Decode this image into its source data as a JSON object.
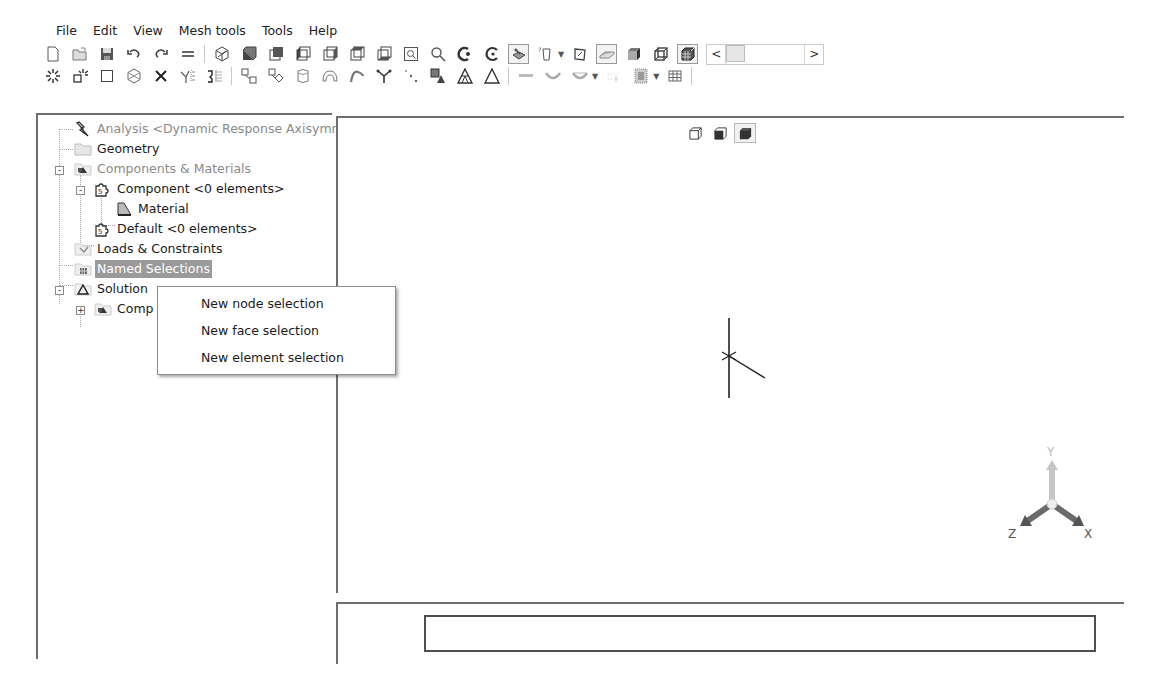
{
  "menubar": {
    "items": [
      "File",
      "Edit",
      "View",
      "Mesh tools",
      "Tools",
      "Help"
    ]
  },
  "toolbar": {
    "row1": [
      {
        "icon": "new-file-icon"
      },
      {
        "icon": "open-folder-icon"
      },
      {
        "icon": "save-icon"
      },
      {
        "icon": "undo-icon"
      },
      {
        "icon": "redo-icon"
      },
      {
        "icon": "equals-icon"
      },
      {
        "icon": "isometric-view-icon"
      },
      {
        "icon": "front-view-icon"
      },
      {
        "icon": "back-view-icon"
      },
      {
        "icon": "left-view-icon"
      },
      {
        "icon": "right-view-icon"
      },
      {
        "icon": "top-view-icon"
      },
      {
        "icon": "bottom-view-icon"
      },
      {
        "icon": "zoom-box-icon"
      },
      {
        "icon": "zoom-icon"
      },
      {
        "icon": "rotate-icon"
      },
      {
        "icon": "pan-icon"
      },
      {
        "icon": "display-style-icon",
        "pressed": true
      },
      {
        "icon": "selection-filter-icon",
        "dropdown": true
      },
      {
        "icon": "sketch-icon"
      },
      {
        "icon": "surface-icon",
        "pressed": true
      },
      {
        "icon": "solid-block-icon"
      },
      {
        "icon": "wireframe-box-icon"
      },
      {
        "icon": "mesh-grid-icon",
        "pressed": true
      }
    ],
    "row2": [
      {
        "icon": "node-burst-icon"
      },
      {
        "icon": "node-box-burst-icon"
      },
      {
        "icon": "square-icon"
      },
      {
        "icon": "cube-wire-icon"
      },
      {
        "icon": "delete-x-icon"
      },
      {
        "icon": "split-tree-icon"
      },
      {
        "icon": "mirror-icon"
      },
      {
        "icon": "connect-nodes-icon"
      },
      {
        "icon": "connect-diamond-icon"
      },
      {
        "icon": "cylinder-icon"
      },
      {
        "icon": "arch-icon"
      },
      {
        "icon": "curve-icon"
      },
      {
        "icon": "branch-icon"
      },
      {
        "icon": "dots-icon"
      },
      {
        "icon": "layered-shapes-icon"
      },
      {
        "icon": "triangle-mesh-icon"
      },
      {
        "icon": "triangle-icon"
      },
      {
        "icon": "beam-icon"
      },
      {
        "icon": "spring-icon"
      },
      {
        "icon": "damper-icon",
        "dropdown": true
      },
      {
        "icon": "dotted-grid-icon"
      },
      {
        "icon": "pattern-icon",
        "dropdown": true
      },
      {
        "icon": "table-icon"
      }
    ],
    "slider": {
      "left_arrow": "<",
      "right_arrow": ">"
    }
  },
  "tree": {
    "nodes": [
      {
        "label": "Analysis <Dynamic Response Axisymr",
        "icon": "analysis-bolt-icon",
        "style": "grey"
      },
      {
        "label": "Geometry",
        "icon": "folder-icon",
        "style": "normal"
      },
      {
        "label": "Components & Materials",
        "icon": "components-icon",
        "style": "grey",
        "expander": "-"
      },
      {
        "label": "Component <0 elements>",
        "icon": "puzzle-icon",
        "style": "normal",
        "expander": "-"
      },
      {
        "label": "Material",
        "icon": "material-icon",
        "style": "normal"
      },
      {
        "label": "Default <0 elements>",
        "icon": "puzzle-icon",
        "style": "normal"
      },
      {
        "label": "Loads & Constraints",
        "icon": "loads-icon",
        "style": "normal"
      },
      {
        "label": "Named Selections",
        "icon": "named-selection-icon",
        "style": "selected"
      },
      {
        "label": "Solution",
        "icon": "solution-triangle-icon",
        "style": "normal",
        "expander": "-"
      },
      {
        "label": "Comp",
        "icon": "components-icon",
        "style": "normal",
        "expander": "+"
      }
    ]
  },
  "context_menu": {
    "items": [
      "New node selection",
      "New face selection",
      "New element selection"
    ]
  },
  "viewport": {
    "view_modes": [
      {
        "icon": "wireframe-cube-icon"
      },
      {
        "icon": "shaded-edges-cube-icon"
      },
      {
        "icon": "shaded-cube-icon",
        "active": true
      }
    ],
    "triad": {
      "x_label": "X",
      "y_label": "Y",
      "z_label": "Z"
    }
  },
  "bottom_panel": {
    "output_value": ""
  }
}
